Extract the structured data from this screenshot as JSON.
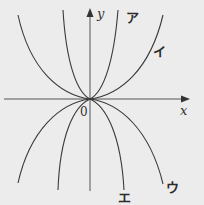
{
  "diagram": {
    "type": "function-graph",
    "axes": {
      "x_label": "x",
      "y_label": "y",
      "origin_label": "0"
    },
    "curves": [
      {
        "id": "a",
        "label": "ア",
        "shape": "steep upward curve tangent to x-axis at origin"
      },
      {
        "id": "i",
        "label": "イ",
        "shape": "wide upward curve tangent to x-axis at origin"
      },
      {
        "id": "u",
        "label": "ウ",
        "shape": "wide downward curve tangent to x-axis at origin"
      },
      {
        "id": "e",
        "label": "エ",
        "shape": "steep downward curve tangent to x-axis at origin"
      }
    ],
    "colors": {
      "background": "#ececec",
      "stroke": "#3a3a3a"
    }
  }
}
